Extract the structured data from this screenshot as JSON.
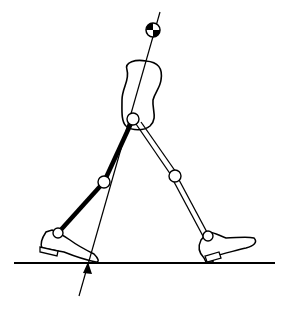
{
  "figure": {
    "colors": {
      "stroke": "#000000",
      "background": "#ffffff"
    },
    "elements": {
      "ground_line": {
        "x1": 14,
        "y1": 263,
        "x2": 275,
        "y2": 263
      },
      "force_line": {
        "x1": 79,
        "y1": 296,
        "x2": 160,
        "y2": 12
      },
      "force_arrow_tip": {
        "x": 88,
        "y": 262
      },
      "center_of_mass": {
        "x": 153,
        "y": 30,
        "r": 7
      },
      "hip_joint": {
        "x": 133,
        "y": 119,
        "r": 6
      },
      "stance_knee": {
        "x": 104,
        "y": 182,
        "r": 6
      },
      "stance_ankle": {
        "x": 58,
        "y": 233,
        "r": 5
      },
      "swing_knee": {
        "x": 175,
        "y": 176,
        "r": 6
      },
      "swing_ankle": {
        "x": 208,
        "y": 236,
        "r": 5
      }
    }
  }
}
